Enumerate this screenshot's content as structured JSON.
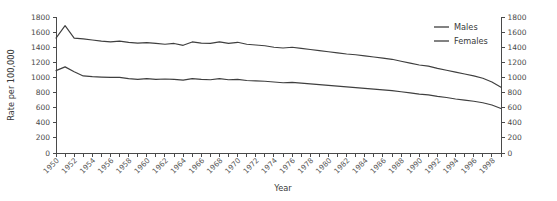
{
  "chart_data": {
    "type": "line",
    "title": "",
    "xlabel": "Year",
    "ylabel": "Rate per 100,000",
    "ylabel_right": "",
    "xlim": [
      1950,
      1999
    ],
    "ylim": [
      0,
      1800
    ],
    "yticks": [
      0,
      200,
      400,
      600,
      800,
      1000,
      1200,
      1400,
      1600,
      1800
    ],
    "ytick_labels": [
      "0",
      "200",
      "400",
      "600",
      "800",
      "1000",
      "1200",
      "1400",
      "1600",
      "1800"
    ],
    "right_axis": true,
    "right_ytick_labels": [
      "0",
      "200",
      "400",
      "600",
      "800",
      "1000",
      "1200",
      "1400",
      "1600",
      "1800"
    ],
    "xtick_labels": [
      "1950",
      "1952",
      "1954",
      "1956",
      "1958",
      "1960",
      "1962",
      "1964",
      "1966",
      "1968",
      "1970",
      "1972",
      "1974",
      "1976",
      "1978",
      "1980",
      "1982",
      "1984",
      "1986",
      "1988",
      "1990",
      "1992",
      "1994",
      "1996",
      "1998"
    ],
    "xtick_label_rotation": -45,
    "xtick_interval_years": 2,
    "minor_xticks_every_year": true,
    "grid": false,
    "legend_position": "top-right",
    "line_color": "#3f3f3f",
    "x": [
      1950,
      1951,
      1952,
      1953,
      1954,
      1955,
      1956,
      1957,
      1958,
      1959,
      1960,
      1961,
      1962,
      1963,
      1964,
      1965,
      1966,
      1967,
      1968,
      1969,
      1970,
      1971,
      1972,
      1973,
      1974,
      1975,
      1976,
      1977,
      1978,
      1979,
      1980,
      1981,
      1982,
      1983,
      1984,
      1985,
      1986,
      1987,
      1988,
      1989,
      1990,
      1991,
      1992,
      1993,
      1994,
      1995,
      1996,
      1997,
      1998,
      1999
    ],
    "series": [
      {
        "name": "Males",
        "values": [
          1520,
          1685,
          1520,
          1510,
          1495,
          1480,
          1470,
          1480,
          1465,
          1455,
          1460,
          1450,
          1440,
          1450,
          1425,
          1470,
          1455,
          1450,
          1470,
          1450,
          1465,
          1440,
          1430,
          1420,
          1400,
          1390,
          1400,
          1385,
          1370,
          1355,
          1340,
          1325,
          1310,
          1300,
          1285,
          1270,
          1255,
          1240,
          1215,
          1190,
          1165,
          1150,
          1120,
          1095,
          1070,
          1045,
          1020,
          990,
          940,
          870
        ]
      },
      {
        "name": "Females",
        "values": [
          1090,
          1140,
          1075,
          1020,
          1010,
          1005,
          1000,
          1000,
          985,
          975,
          985,
          975,
          980,
          975,
          965,
          985,
          975,
          970,
          985,
          970,
          975,
          960,
          955,
          950,
          940,
          930,
          935,
          925,
          915,
          905,
          895,
          885,
          875,
          865,
          855,
          845,
          835,
          825,
          810,
          795,
          780,
          770,
          750,
          735,
          715,
          700,
          685,
          665,
          635,
          590
        ]
      }
    ]
  },
  "legend": {
    "items": [
      {
        "label": "Males"
      },
      {
        "label": "Females"
      }
    ]
  }
}
